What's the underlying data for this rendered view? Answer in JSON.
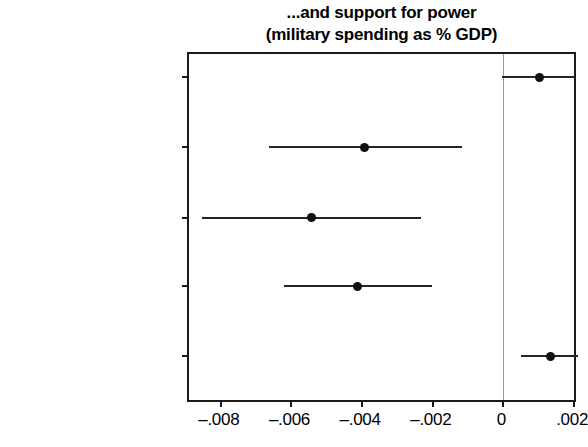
{
  "chart_data": {
    "type": "scatter",
    "subtype": "coefficient-plot-with-confidence-intervals",
    "title": "...and support for power",
    "subtitle": "(military spending as % GDP)",
    "title_lines": [
      "...and support for power",
      "(military spending as % GDP)"
    ],
    "xlabel": "",
    "ylabel": "",
    "xlim": [
      -0.0089,
      0.00211
    ],
    "xticks": [
      -0.008,
      -0.006,
      -0.004,
      -0.002,
      0,
      0.002
    ],
    "xtick_labels": [
      "-.008",
      "-.006",
      "-.004",
      "-.002",
      "0",
      ".002"
    ],
    "grid": false,
    "legend": null,
    "reference_line": {
      "value": 0,
      "orientation": "vertical",
      "color": "#9a9a9a"
    },
    "categories": [
      "Mainstream vote share",
      "Radical right vote share",
      "Radical left vote share",
      "All Radical vote share",
      "Net Mainstream vote share"
    ],
    "category_lines": [
      [
        "Mainstream vote",
        "share"
      ],
      [
        "Radical right vote",
        "share"
      ],
      [
        "Radical left vote",
        "share"
      ],
      [
        "All Radical vote",
        "share"
      ],
      [
        "Net Mainstream",
        "vote share"
      ]
    ],
    "point_color": "#111111",
    "ci_color": "#262626",
    "points": [
      {
        "category": "Mainstream vote share",
        "estimate": 0.00103,
        "ci_low": -5e-05,
        "ci_high": 0.00203
      },
      {
        "category": "Radical right vote share",
        "estimate": -0.00392,
        "ci_low": -0.00664,
        "ci_high": -0.00117
      },
      {
        "category": "Radical left vote share",
        "estimate": -0.00542,
        "ci_low": -0.00853,
        "ci_high": -0.00233
      },
      {
        "category": "All Radical vote share",
        "estimate": -0.00414,
        "ci_low": -0.0062,
        "ci_high": -0.00203
      },
      {
        "category": "Net Mainstream vote share",
        "estimate": 0.00133,
        "ci_low": 0.0005,
        "ci_high": 0.00214
      }
    ]
  }
}
